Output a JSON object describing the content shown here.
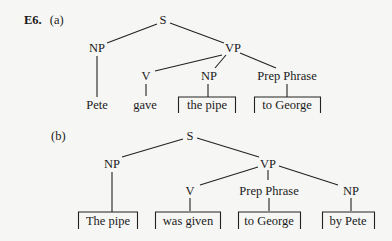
{
  "exercise": {
    "number": "E6.",
    "tree_a": {
      "label": "(a)",
      "root": "S",
      "subject_np": "NP",
      "vp": "VP",
      "v": "V",
      "object_np": "NP",
      "pp": "Prep Phrase",
      "leaves": {
        "subject": "Pete",
        "verb": "gave",
        "object": "the pipe",
        "pp": "to George"
      }
    },
    "tree_b": {
      "label": "(b)",
      "root": "S",
      "subject_np": "NP",
      "vp": "VP",
      "v": "V",
      "pp": "Prep Phrase",
      "agent_np": "NP",
      "leaves": {
        "subject": "The pipe",
        "verb": "was given",
        "pp": "to George",
        "agent": "by Pete"
      }
    }
  }
}
